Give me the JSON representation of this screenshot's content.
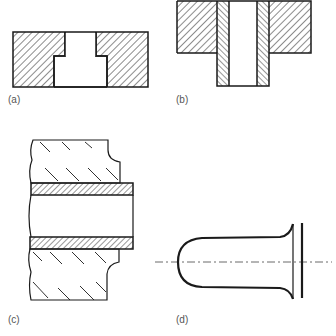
{
  "figure": {
    "stroke_color": "#1a1a1a",
    "label_color": "#555555",
    "panels": [
      {
        "id": "a",
        "label": "(a)",
        "content": "block with stepped through-hole (counterbore), hatched section"
      },
      {
        "id": "b",
        "label": "(b)",
        "content": "flanged bushing inserted in hatched block, hatched sleeve walls"
      },
      {
        "id": "c",
        "label": "(c)",
        "content": "tube sleeve passing through broken-out wall section"
      },
      {
        "id": "d",
        "label": "(d)",
        "content": "closed-end flared cup with centerline and end plate"
      }
    ]
  }
}
